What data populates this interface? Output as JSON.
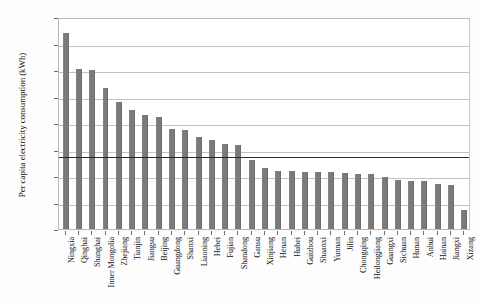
{
  "chart_data": {
    "type": "bar",
    "title": "",
    "subtitle": "",
    "xlabel": "",
    "ylabel": "Per capita electricity consumption (kWh)",
    "ylim": [
      0,
      8000
    ],
    "ytick_labels": [
      "8000",
      "7000",
      "6000",
      "5000",
      "4000",
      "3000",
      "2000",
      "1000",
      "0"
    ],
    "ytick_values": [
      8000,
      7000,
      6000,
      5000,
      4000,
      3000,
      2000,
      1000,
      0
    ],
    "grid": "horizontal",
    "legend": "none",
    "legend_position": "none",
    "bar_color": "#7a7a7a",
    "reference_line": {
      "label": "national average",
      "value": 2800,
      "color": "#2b2b2b"
    },
    "categories": [
      "Ningxia",
      "Qinghai",
      "Shanghai",
      "Inner Mongolia",
      "Zhejiang",
      "Tianjin",
      "Jiangsu",
      "Beijing",
      "Guangdong",
      "Shanxi",
      "Liaoning",
      "Hebei",
      "Fujian",
      "Shandong",
      "Gansu",
      "Xinjiang",
      "Henan",
      "Hubei",
      "Guizhou",
      "Shaanxi",
      "Yunnan",
      "Jilin",
      "Chongqing",
      "Heilongjiang",
      "Guangxi",
      "Sichuan",
      "Hunan",
      "Anhui",
      "Hainan",
      "Jiangxi",
      "Xizang"
    ],
    "values": [
      7400,
      6050,
      6010,
      5340,
      4800,
      4500,
      4300,
      4240,
      3760,
      3720,
      3470,
      3360,
      3190,
      3180,
      2620,
      2320,
      2200,
      2190,
      2170,
      2170,
      2150,
      2100,
      2090,
      2080,
      1980,
      1840,
      1820,
      1800,
      1710,
      1660,
      700
    ]
  }
}
